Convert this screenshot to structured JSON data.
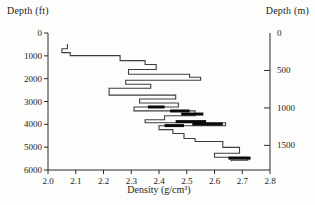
{
  "figure": {
    "left_axis_title": "Depth (ft)",
    "right_axis_title": "Depth (m)",
    "x_axis_title": "Density (g/cm³)"
  },
  "chart_data": {
    "type": "line",
    "subtype": "step-well-log",
    "title": "",
    "xlabel": "Density (g/cm³)",
    "ylabel_left": "Depth (ft)",
    "ylabel_right": "Depth (m)",
    "xlim": [
      2.0,
      2.8
    ],
    "ylim_ft": [
      0,
      6000
    ],
    "x_ticks": [
      2.0,
      2.1,
      2.2,
      2.3,
      2.4,
      2.5,
      2.6,
      2.7,
      2.8
    ],
    "y_ticks_ft": [
      0,
      1000,
      2000,
      3000,
      4000,
      5000,
      6000
    ],
    "y_ticks_m": [
      0,
      500,
      1000,
      1500
    ],
    "m_to_ft": 3.2808,
    "grid": false,
    "legend": "none",
    "axis_color": "#2b2b2b",
    "line_color": "#3d3d3d",
    "bold_color": "#0a0a0a",
    "curve_step_vertices": [
      [
        2.07,
        480
      ],
      [
        2.07,
        690
      ],
      [
        2.05,
        690
      ],
      [
        2.05,
        860
      ],
      [
        2.08,
        860
      ],
      [
        2.08,
        990
      ],
      [
        2.26,
        990
      ],
      [
        2.26,
        1210
      ],
      [
        2.35,
        1210
      ],
      [
        2.35,
        1380
      ],
      [
        2.39,
        1380
      ],
      [
        2.39,
        1600
      ],
      [
        2.29,
        1600
      ],
      [
        2.29,
        1810
      ],
      [
        2.51,
        1810
      ],
      [
        2.51,
        1940
      ],
      [
        2.55,
        1940
      ],
      [
        2.55,
        2070
      ],
      [
        2.28,
        2070
      ],
      [
        2.28,
        2245
      ],
      [
        2.37,
        2245
      ],
      [
        2.37,
        2420
      ],
      [
        2.22,
        2420
      ],
      [
        2.22,
        2720
      ],
      [
        2.46,
        2720
      ],
      [
        2.46,
        2890
      ],
      [
        2.33,
        2890
      ],
      [
        2.33,
        3065
      ],
      [
        2.47,
        3065
      ],
      [
        2.47,
        3240
      ],
      [
        2.31,
        3240
      ],
      [
        2.31,
        3410
      ],
      [
        2.53,
        3410
      ],
      [
        2.53,
        3625
      ],
      [
        2.42,
        3625
      ],
      [
        2.42,
        3800
      ],
      [
        2.35,
        3800
      ],
      [
        2.35,
        3930
      ],
      [
        2.64,
        3930
      ],
      [
        2.64,
        4060
      ],
      [
        2.4,
        4060
      ],
      [
        2.4,
        4230
      ],
      [
        2.45,
        4230
      ],
      [
        2.45,
        4400
      ],
      [
        2.49,
        4400
      ],
      [
        2.49,
        4620
      ],
      [
        2.53,
        4620
      ],
      [
        2.53,
        4750
      ],
      [
        2.63,
        4750
      ],
      [
        2.63,
        5010
      ],
      [
        2.69,
        5010
      ],
      [
        2.69,
        5270
      ],
      [
        2.6,
        5270
      ],
      [
        2.6,
        5440
      ],
      [
        2.72,
        5440
      ],
      [
        2.72,
        5570
      ],
      [
        2.66,
        5570
      ],
      [
        2.66,
        5620
      ]
    ],
    "bold_segments": [
      {
        "d1": 2.36,
        "d2": 2.42,
        "depth": 3240
      },
      {
        "d1": 2.44,
        "d2": 2.51,
        "depth": 3415
      },
      {
        "d1": 2.48,
        "d2": 2.56,
        "depth": 3550
      },
      {
        "d1": 2.46,
        "d2": 2.57,
        "depth": 3880
      },
      {
        "d1": 2.52,
        "d2": 2.63,
        "depth": 3990
      },
      {
        "d1": 2.42,
        "d2": 2.49,
        "depth": 4055
      },
      {
        "d1": 2.65,
        "d2": 2.73,
        "depth": 5480
      }
    ]
  }
}
